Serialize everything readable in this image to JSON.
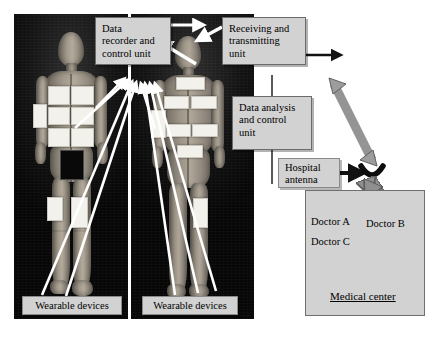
{
  "figure": {
    "colors": {
      "box_fill": "#d2d2d2",
      "box_border": "#6b6b6b",
      "photo_background": "#0b0b0b",
      "white_arrow": "#ffffff",
      "black_arrow": "#111111",
      "gray_arrow": "#9a9a9a",
      "skin": "#a29a8c",
      "patch": "#f2f1ec"
    }
  },
  "boxes": {
    "data_recorder": {
      "label": "Data recorder and control unit",
      "lines": [
        "Data",
        "recorder and",
        "control unit"
      ]
    },
    "receiving_unit": {
      "label": "Receiving and transmitting unit",
      "lines": [
        "Receiving and",
        "transmitting",
        "unit"
      ]
    },
    "data_analysis": {
      "label": "Data analysis and control unit",
      "lines": [
        "Data analysis",
        "and control",
        "unit"
      ]
    },
    "hospital_antenna": {
      "label": "Hospital antenna",
      "lines": [
        "Hospital",
        "antenna"
      ]
    },
    "wearable_left": {
      "label": "Wearable devices"
    },
    "wearable_right": {
      "label": "Wearable devices"
    }
  },
  "medical_center": {
    "title": "Medical center",
    "doctors": [
      {
        "id": "a",
        "label": "Doctor A"
      },
      {
        "id": "b",
        "label": "Doctor B"
      },
      {
        "id": "c",
        "label": "Doctor C"
      }
    ]
  },
  "icons": {
    "satellite_dish": "satellite-dish-icon",
    "uplink_arrow": "bidirectional-uplink-arrow-icon",
    "antenna_pointer": "black-right-arrow-icon",
    "outgoing_arrow": "black-right-arrow-icon"
  },
  "subjects": [
    {
      "id": "left",
      "name": "subject-with-wearable-sensors-front-left",
      "sensor_count": 9
    },
    {
      "id": "right",
      "name": "subject-with-wearable-sensors-front-right",
      "sensor_count": 8
    }
  ]
}
